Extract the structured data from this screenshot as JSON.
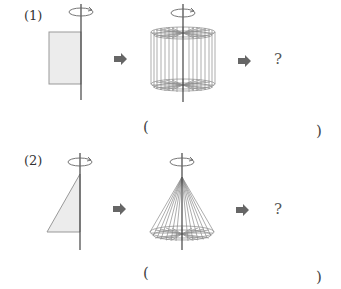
{
  "problems": [
    {
      "number_label": "(1)",
      "original_shape": "rectangle",
      "solid_result": "cylinder",
      "answer_prompt": "?",
      "answer_open": "(",
      "answer_close": ")"
    },
    {
      "number_label": "(2)",
      "original_shape": "right-triangle",
      "solid_result": "cone",
      "answer_prompt": "?",
      "answer_open": "(",
      "answer_close": ")"
    }
  ],
  "icons": {
    "rotation": "rotation-arrow-icon",
    "arrow": "right-arrow-icon"
  },
  "colors": {
    "shape_fill": "#ececec",
    "shape_stroke": "#999999",
    "axis": "#444444",
    "arrow": "#666666",
    "wire": "#8a8a8a"
  }
}
